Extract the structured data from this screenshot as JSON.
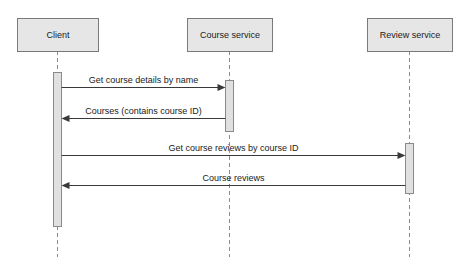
{
  "diagram": {
    "type": "uml-sequence-diagram",
    "canvas": {
      "width": 464,
      "height": 267,
      "background": "#ffffff"
    },
    "style": {
      "box_fill": "#e6e6e6",
      "box_stroke": "#7a7a7a",
      "activation_fill": "#e0e0e0",
      "activation_stroke": "#8a8a8a",
      "lifeline_stroke": "#8c8c8c",
      "message_stroke": "#3a3a3a",
      "text_color": "#1a1a1a"
    },
    "participants": [
      {
        "id": "client",
        "label": "Client",
        "box": {
          "x": 17,
          "y": 18,
          "width": 81,
          "height": 33
        },
        "lifeline_x": 57.5,
        "lifeline_top": 51,
        "lifeline_bottom": 257,
        "activations": [
          {
            "x": 53.5,
            "y": 72,
            "width": 8,
            "height": 154
          }
        ]
      },
      {
        "id": "course-service",
        "label": "Course service",
        "box": {
          "x": 187,
          "y": 18,
          "width": 85,
          "height": 33
        },
        "lifeline_x": 229.5,
        "lifeline_top": 51,
        "lifeline_bottom": 257,
        "activations": [
          {
            "x": 225.5,
            "y": 80,
            "width": 8,
            "height": 51
          }
        ]
      },
      {
        "id": "review-service",
        "label": "Review service",
        "box": {
          "x": 367,
          "y": 18,
          "width": 85,
          "height": 33
        },
        "lifeline_x": 409.5,
        "lifeline_top": 51,
        "lifeline_bottom": 257,
        "activations": [
          {
            "x": 405.5,
            "y": 143,
            "width": 8,
            "height": 50
          }
        ]
      }
    ],
    "messages": [
      {
        "index": 1,
        "label": "Get course details by name",
        "from": "client",
        "to": "course-service",
        "direction": "right",
        "kind": "call",
        "y": 87,
        "x_start": 61.5,
        "x_end": 225.5,
        "label_x": 143.5,
        "label_y": 83
      },
      {
        "index": 2,
        "label": "Courses (contains course ID)",
        "from": "course-service",
        "to": "client",
        "direction": "left",
        "kind": "return",
        "y": 118,
        "x_start": 225.5,
        "x_end": 61.5,
        "label_x": 143.5,
        "label_y": 114
      },
      {
        "index": 3,
        "label": "Get course reviews by course ID",
        "from": "client",
        "to": "review-service",
        "direction": "right",
        "kind": "call",
        "y": 155,
        "x_start": 61.5,
        "x_end": 405.5,
        "label_x": 233.5,
        "label_y": 151
      },
      {
        "index": 4,
        "label": "Course reviews",
        "from": "review-service",
        "to": "client",
        "direction": "left",
        "kind": "return",
        "y": 185,
        "x_start": 405.5,
        "x_end": 61.5,
        "label_x": 233.5,
        "label_y": 181
      }
    ]
  }
}
